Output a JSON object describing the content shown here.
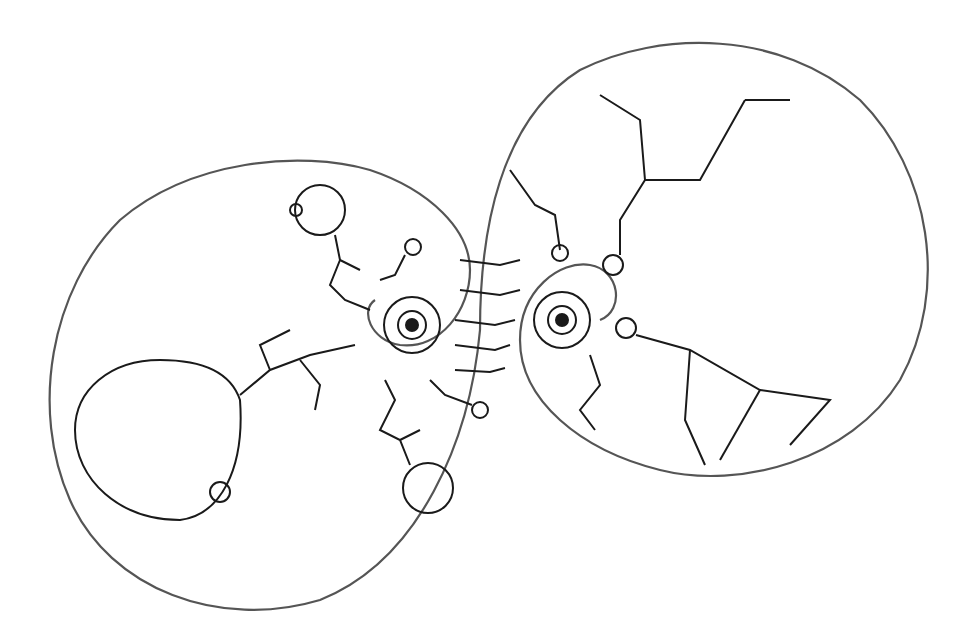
{
  "figure": {
    "stroke_color": "#1a1a1a",
    "outline_color": "#555555",
    "background": "#ffffff"
  }
}
